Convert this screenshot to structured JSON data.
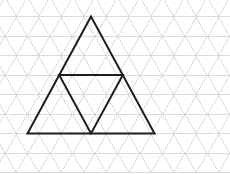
{
  "canvas": {
    "width": 230,
    "height": 174,
    "background_color": "#ffffff",
    "title": "Isometric triangular grid with nested triangle figure"
  },
  "grid": {
    "name": "triangular-isometric-grid",
    "color": "#d2d2d2",
    "stroke_width": 0.8,
    "horizontal_pitch": 22.5,
    "row_height": 19.5,
    "row_y_positions": [
      -3,
      16.5,
      36,
      55.5,
      75,
      94.5,
      114,
      133.5,
      153,
      172.5
    ],
    "column_x_positions": [
      -6.25,
      5,
      16.25,
      27.5,
      38.75,
      50,
      61.25,
      72.5,
      83.75,
      95,
      106.25,
      117.5,
      128.75,
      140,
      151.25,
      162.5,
      173.75,
      185,
      196.25,
      207.5,
      218.75,
      230,
      241.25
    ],
    "visible": true
  },
  "figure": {
    "name": "nested-triangle-figure",
    "color": "#1d1d1d",
    "stroke_width": 2,
    "outer_triangle": {
      "label": "outer-triangle",
      "points": [
        [
          91,
          16.5
        ],
        [
          27.5,
          133.5
        ],
        [
          154.5,
          133.5
        ]
      ],
      "side_rows": 6
    },
    "inner_triangle": {
      "label": "inner-inverted-triangle",
      "points": [
        [
          59.2,
          75
        ],
        [
          122.8,
          75
        ],
        [
          91,
          133.5
        ]
      ],
      "orientation": "inverted",
      "side_rows": 3
    }
  },
  "chart_data": {
    "type": "diagram",
    "shapes": [
      {
        "name": "outer-triangle",
        "kind": "polygon",
        "vertices": [
          [
            91,
            16.5
          ],
          [
            27.5,
            133.5
          ],
          [
            154.5,
            133.5
          ]
        ],
        "stroke": "#1d1d1d",
        "stroke_width": 2,
        "fill": "none"
      },
      {
        "name": "inner-inverted-triangle",
        "kind": "polygon",
        "vertices": [
          [
            59.2,
            75
          ],
          [
            122.8,
            75
          ],
          [
            91,
            133.5
          ]
        ],
        "stroke": "#1d1d1d",
        "stroke_width": 2,
        "fill": "none"
      }
    ],
    "grid": {
      "kind": "triangular",
      "stroke": "#d2d2d2",
      "unit_width": 22.5,
      "unit_height": 19.5
    }
  }
}
